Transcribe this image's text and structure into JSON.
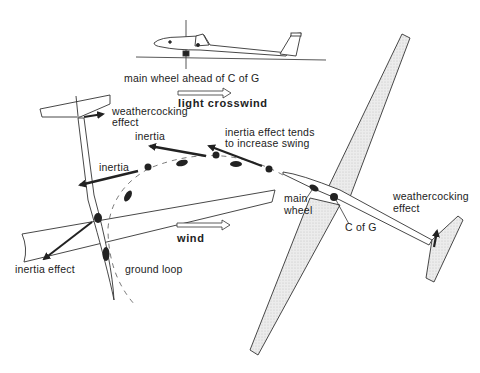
{
  "diagram": {
    "labels": {
      "main_wheel_ahead": "main wheel ahead of C of G",
      "light_crosswind": "light crosswind",
      "weathercocking_left_1": "weathercocking",
      "weathercocking_left_2": "effect",
      "inertia_top": "inertia",
      "inertia_increase_1": "inertia effect tends",
      "inertia_increase_2": "to increase swing",
      "inertia_left": "inertia",
      "inertia_effect": "inertia effect",
      "ground_loop": "ground loop",
      "wind": "wind",
      "main_wheel_1": "main",
      "main_wheel_2": "wheel",
      "c_of_g": "C of G",
      "weathercocking_right_1": "weathercocking",
      "weathercocking_right_2": "effect"
    },
    "icons": {
      "side_glider": "glider-side-view-icon",
      "crosswind_arrow": "hollow-arrow-right",
      "wind_arrow": "hollow-arrow-right"
    },
    "colors": {
      "ink": "#222222",
      "wing_fill": "#e6e6e6",
      "background": "#ffffff"
    }
  }
}
